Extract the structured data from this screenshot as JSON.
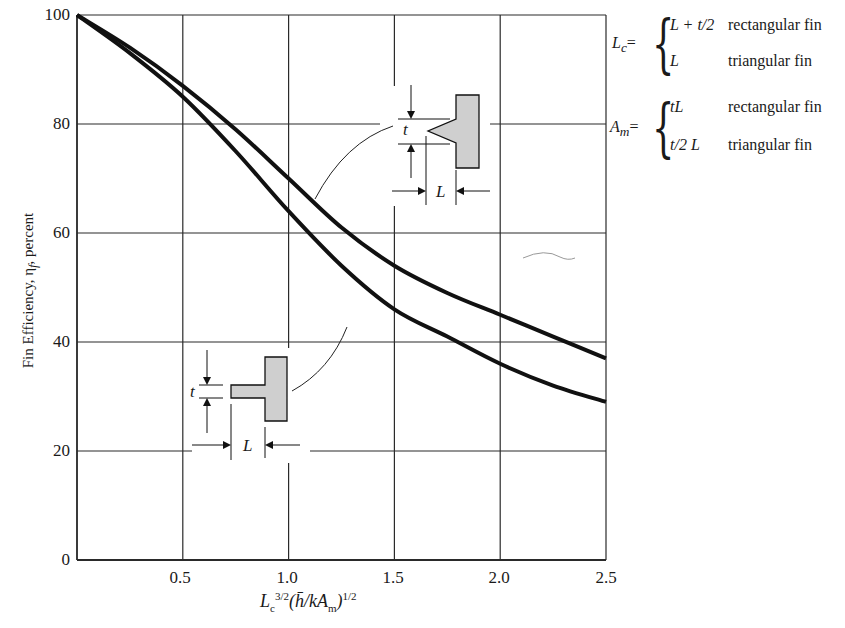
{
  "chart_data": {
    "type": "line",
    "title": "",
    "xlabel": "L_c^{3/2}(h̄/kA_m)^{1/2}",
    "ylabel": "Fin Efficiency, η_f, percent",
    "xlim": [
      0,
      2.5
    ],
    "ylim": [
      0,
      100
    ],
    "grid": true,
    "x_ticks": [
      "0.5",
      "1.0",
      "1.5",
      "2.0",
      "2.5"
    ],
    "y_ticks": [
      "0",
      "20",
      "40",
      "60",
      "80",
      "100"
    ],
    "x": [
      0,
      0.25,
      0.5,
      0.75,
      1.0,
      1.25,
      1.5,
      1.75,
      2.0,
      2.25,
      2.5
    ],
    "series": [
      {
        "name": "triangular fin",
        "values": [
          100,
          94,
          87,
          79,
          70,
          61,
          54,
          49,
          45,
          41,
          37
        ]
      },
      {
        "name": "rectangular fin",
        "values": [
          100,
          93,
          85,
          75,
          64,
          54,
          46,
          41,
          36,
          32,
          29
        ]
      }
    ],
    "annotations": [
      {
        "text": "triangular fin profile sketch with dimensions t and L",
        "points_to": "upper curve"
      },
      {
        "text": "rectangular fin profile sketch with dimensions t and L",
        "points_to": "lower curve"
      }
    ]
  },
  "axis": {
    "ylabel_text": "Fin Efficiency, η",
    "ylabel_sub": "f",
    "ylabel_tail": ", percent",
    "x_ticks": [
      "0.5",
      "1.0",
      "1.5",
      "2.0",
      "2.5"
    ],
    "y_ticks": [
      "100",
      "80",
      "60",
      "40",
      "20",
      "0"
    ],
    "xlabel": {
      "base": "L",
      "sub1": "c",
      "sup1": "3/2",
      "mid": "(h̄/kA",
      "sub2": "m",
      "close": ")",
      "sup2": "1/2"
    }
  },
  "legend": {
    "lc_label": "L",
    "lc_sub": "c",
    "am_label": "A",
    "am_sub": "m",
    "eq": "=",
    "rows": [
      {
        "expr": "L + t/2",
        "desc": "rectangular fin"
      },
      {
        "expr": "L",
        "desc": "triangular fin"
      },
      {
        "expr": "tL",
        "desc": "rectangular fin"
      },
      {
        "expr": "t/2 L",
        "desc": "triangular fin"
      }
    ]
  },
  "sketch_labels": {
    "t": "t",
    "L": "L"
  },
  "colors": {
    "curve": "#111111",
    "grid": "#2a2a2a",
    "fin_fill": "#cfcfcf",
    "background": "#ffffff"
  }
}
